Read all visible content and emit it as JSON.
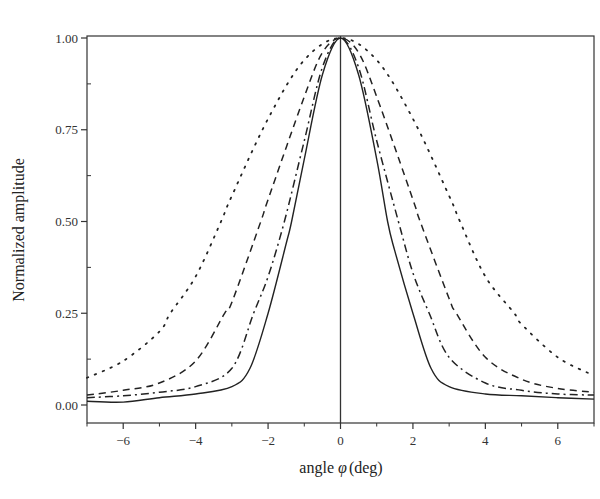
{
  "chart_data": {
    "type": "line",
    "title": "",
    "xlabel": "angle φ (deg)",
    "xlabel_parts": {
      "prefix": "angle ",
      "symbol": "φ",
      "suffix": "(deg)"
    },
    "ylabel": "Normalized amplitude",
    "xlim": [
      -7,
      7
    ],
    "ylim": [
      -0.065,
      1.0
    ],
    "x_ticks": [
      -6,
      -4,
      -2,
      0,
      2,
      4,
      6
    ],
    "x_tick_labels": [
      "−6",
      "−4",
      "−2",
      "0",
      "2",
      "4",
      "6"
    ],
    "x_minor_ticks": [
      -7,
      -5,
      -3,
      -1,
      1,
      3,
      5,
      7
    ],
    "y_ticks": [
      0.0,
      0.25,
      0.5,
      0.75,
      1.0
    ],
    "y_tick_labels": [
      "0.00",
      "0.25",
      "0.50",
      "0.75",
      "1.00"
    ],
    "y_minor_ticks": [
      0.125,
      0.375,
      0.625,
      0.875
    ],
    "grid": false,
    "legend": null,
    "vertical_reference_line_x": 0,
    "series": [
      {
        "name": "solid",
        "style": "solid",
        "x": [
          -7,
          -6,
          -5,
          -4,
          -3,
          -2.5,
          -2,
          -1.5,
          -1.35,
          -1,
          -0.5,
          0,
          0.5,
          1,
          1.3,
          1.5,
          2,
          2.5,
          3,
          4,
          5,
          6,
          7
        ],
        "values": [
          0.01,
          0.008,
          0.02,
          0.03,
          0.05,
          0.1,
          0.25,
          0.44,
          0.5,
          0.67,
          0.9,
          1.0,
          0.9,
          0.67,
          0.5,
          0.42,
          0.25,
          0.1,
          0.05,
          0.03,
          0.025,
          0.02,
          0.016
        ]
      },
      {
        "name": "dash-dot",
        "style": "dashdot",
        "x": [
          -7,
          -6,
          -5,
          -4,
          -3,
          -2.4,
          -2,
          -1.55,
          -1,
          -0.5,
          0,
          0.5,
          1,
          1.6,
          2,
          2.45,
          3,
          4,
          5,
          6,
          7
        ],
        "values": [
          0.02,
          0.025,
          0.035,
          0.05,
          0.1,
          0.25,
          0.35,
          0.5,
          0.72,
          0.92,
          1.0,
          0.92,
          0.72,
          0.5,
          0.36,
          0.25,
          0.13,
          0.06,
          0.04,
          0.03,
          0.027
        ]
      },
      {
        "name": "dashed",
        "style": "dashed",
        "x": [
          -7,
          -6,
          -5,
          -4,
          -3.2,
          -3,
          -2.2,
          -2,
          -1,
          -0.5,
          0,
          0.5,
          1,
          2,
          2.2,
          3,
          3.2,
          4,
          5,
          6,
          7
        ],
        "values": [
          0.027,
          0.04,
          0.06,
          0.12,
          0.25,
          0.28,
          0.5,
          0.56,
          0.84,
          0.96,
          1.0,
          0.96,
          0.84,
          0.56,
          0.5,
          0.29,
          0.25,
          0.13,
          0.07,
          0.045,
          0.035
        ]
      },
      {
        "name": "dotted",
        "style": "dotted",
        "x": [
          -7,
          -6,
          -5,
          -4.7,
          -4,
          -3.3,
          -3,
          -2,
          -1,
          0,
          1,
          2,
          3,
          3.3,
          4,
          4.8,
          5,
          6,
          7
        ],
        "values": [
          0.074,
          0.12,
          0.2,
          0.25,
          0.35,
          0.5,
          0.57,
          0.78,
          0.94,
          1.0,
          0.94,
          0.78,
          0.57,
          0.5,
          0.35,
          0.25,
          0.22,
          0.13,
          0.08
        ]
      }
    ]
  },
  "colors": {
    "line": "#222222",
    "axis": "#333333",
    "background": "#ffffff"
  }
}
